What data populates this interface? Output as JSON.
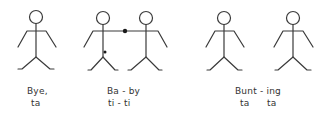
{
  "groups": [
    {
      "id": "bye-ta",
      "word": "Bye,",
      "rhythm": "ta",
      "figures": 1,
      "description": "single standing stick figure"
    },
    {
      "id": "ba-by",
      "word": "Ba - by",
      "rhythm": "ti - ti",
      "figures": 2,
      "description": "two stick figures holding hands, joined by a dot"
    },
    {
      "id": "bunt-ing",
      "word": "Bunt - ing",
      "rhythm_1": "ta",
      "rhythm_2": "ta",
      "figures": 2,
      "description": "two separate standing stick figures"
    }
  ],
  "colors": {
    "line": "#3a3a3a",
    "text": "#333333",
    "background": "#ffffff"
  }
}
